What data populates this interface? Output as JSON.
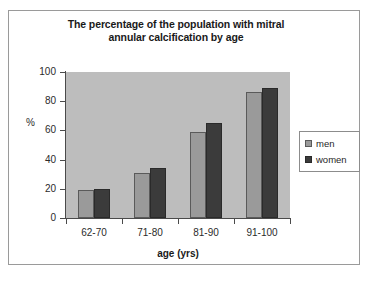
{
  "chart_data": {
    "type": "bar",
    "title": "The percentage of the population with mitral annular calcification by age",
    "title_line1": "The percentage of the population with mitral",
    "title_line2": "annular calcification by age",
    "xlabel": "age (yrs)",
    "ylabel": "%",
    "categories": [
      "62-70",
      "71-80",
      "81-90",
      "91-100"
    ],
    "series": [
      {
        "name": "men",
        "values": [
          19,
          31,
          59,
          86
        ],
        "color": "#9a9a9a"
      },
      {
        "name": "women",
        "values": [
          20,
          34,
          65,
          89
        ],
        "color": "#3b3b3b"
      }
    ],
    "ylim": [
      0,
      100
    ],
    "yticks": [
      100,
      80,
      60,
      40,
      20,
      0
    ],
    "ytick_labels": [
      "100",
      "80",
      "60",
      "40",
      "20",
      "0"
    ],
    "grid": false,
    "legend_position": "right",
    "plot_background": "#bdbdbd",
    "figure_background": "#ffffff"
  },
  "legend": {
    "entries": [
      {
        "label": "men",
        "swatch": "men"
      },
      {
        "label": "women",
        "swatch": "women"
      }
    ]
  },
  "caption": {
    "text": ""
  }
}
